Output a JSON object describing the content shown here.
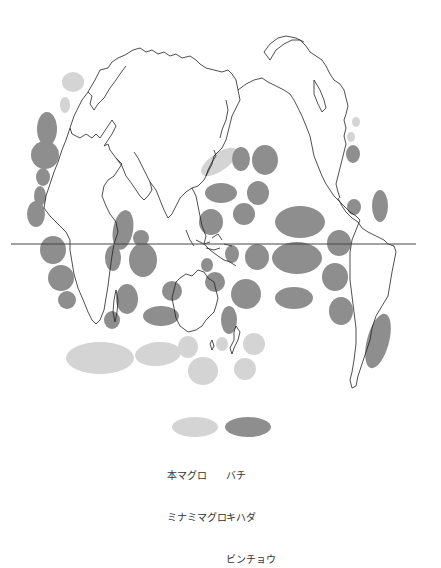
{
  "map": {
    "title": "",
    "projection": "polar-centered world map",
    "equator_line": {
      "x1": 11,
      "x2": 416,
      "y": 244,
      "color": "#444444"
    },
    "colors": {
      "light_species": "#d4d4d4",
      "dark_species": "#8e8e8e",
      "coastline": "#222222",
      "background": "#ffffff"
    },
    "light_areas": [
      {
        "cx": 73,
        "cy": 82,
        "rx": 11,
        "ry": 10,
        "rot": 0
      },
      {
        "cx": 65,
        "cy": 105,
        "rx": 5,
        "ry": 8,
        "rot": 0
      },
      {
        "cx": 356,
        "cy": 122,
        "rx": 4,
        "ry": 5,
        "rot": 0
      },
      {
        "cx": 351,
        "cy": 137,
        "rx": 4,
        "ry": 5,
        "rot": 0
      },
      {
        "cx": 219,
        "cy": 162,
        "rx": 21,
        "ry": 9,
        "rot": -35
      },
      {
        "cx": 100,
        "cy": 358,
        "rx": 34,
        "ry": 16,
        "rot": 0
      },
      {
        "cx": 158,
        "cy": 354,
        "rx": 23,
        "ry": 12,
        "rot": -5
      },
      {
        "cx": 188,
        "cy": 347,
        "rx": 10,
        "ry": 11,
        "rot": 0
      },
      {
        "cx": 203,
        "cy": 371,
        "rx": 15,
        "ry": 14,
        "rot": 0
      },
      {
        "cx": 222,
        "cy": 344,
        "rx": 6,
        "ry": 7,
        "rot": 0
      },
      {
        "cx": 254,
        "cy": 344,
        "rx": 11,
        "ry": 11,
        "rot": 0
      },
      {
        "cx": 245,
        "cy": 369,
        "rx": 11,
        "ry": 11,
        "rot": 0
      }
    ],
    "dark_areas": [
      {
        "cx": 47,
        "cy": 129,
        "rx": 10,
        "ry": 17,
        "rot": 0
      },
      {
        "cx": 45,
        "cy": 155,
        "rx": 14,
        "ry": 14,
        "rot": 0
      },
      {
        "cx": 43,
        "cy": 177,
        "rx": 7,
        "ry": 9,
        "rot": 0
      },
      {
        "cx": 40,
        "cy": 196,
        "rx": 6,
        "ry": 10,
        "rot": 0
      },
      {
        "cx": 36,
        "cy": 214,
        "rx": 9,
        "ry": 13,
        "rot": 0
      },
      {
        "cx": 53,
        "cy": 250,
        "rx": 13,
        "ry": 14,
        "rot": 0
      },
      {
        "cx": 61,
        "cy": 278,
        "rx": 13,
        "ry": 13,
        "rot": 0
      },
      {
        "cx": 67,
        "cy": 300,
        "rx": 9,
        "ry": 9,
        "rot": 0
      },
      {
        "cx": 123,
        "cy": 230,
        "rx": 10,
        "ry": 20,
        "rot": 10
      },
      {
        "cx": 141,
        "cy": 238,
        "rx": 8,
        "ry": 8,
        "rot": 0
      },
      {
        "cx": 143,
        "cy": 260,
        "rx": 14,
        "ry": 17,
        "rot": 0
      },
      {
        "cx": 113,
        "cy": 258,
        "rx": 8,
        "ry": 13,
        "rot": 0
      },
      {
        "cx": 127,
        "cy": 299,
        "rx": 11,
        "ry": 15,
        "rot": 0
      },
      {
        "cx": 112,
        "cy": 320,
        "rx": 8,
        "ry": 9,
        "rot": 0
      },
      {
        "cx": 172,
        "cy": 291,
        "rx": 10,
        "ry": 10,
        "rot": 0
      },
      {
        "cx": 161,
        "cy": 316,
        "rx": 18,
        "ry": 10,
        "rot": 0
      },
      {
        "cx": 241,
        "cy": 159,
        "rx": 9,
        "ry": 12,
        "rot": 0
      },
      {
        "cx": 265,
        "cy": 160,
        "rx": 13,
        "ry": 15,
        "rot": 0
      },
      {
        "cx": 221,
        "cy": 193,
        "rx": 16,
        "ry": 10,
        "rot": 0
      },
      {
        "cx": 258,
        "cy": 193,
        "rx": 11,
        "ry": 12,
        "rot": 0
      },
      {
        "cx": 211,
        "cy": 222,
        "rx": 12,
        "ry": 13,
        "rot": 0
      },
      {
        "cx": 244,
        "cy": 214,
        "rx": 11,
        "ry": 11,
        "rot": 0
      },
      {
        "cx": 300,
        "cy": 222,
        "rx": 25,
        "ry": 16,
        "rot": 0
      },
      {
        "cx": 297,
        "cy": 258,
        "rx": 25,
        "ry": 16,
        "rot": 0
      },
      {
        "cx": 257,
        "cy": 257,
        "rx": 12,
        "ry": 13,
        "rot": 0
      },
      {
        "cx": 232,
        "cy": 254,
        "rx": 7,
        "ry": 9,
        "rot": 0
      },
      {
        "cx": 339,
        "cy": 243,
        "rx": 12,
        "ry": 13,
        "rot": 0
      },
      {
        "cx": 335,
        "cy": 277,
        "rx": 13,
        "ry": 14,
        "rot": 0
      },
      {
        "cx": 341,
        "cy": 311,
        "rx": 12,
        "ry": 14,
        "rot": 0
      },
      {
        "cx": 215,
        "cy": 282,
        "rx": 10,
        "ry": 10,
        "rot": 0
      },
      {
        "cx": 246,
        "cy": 294,
        "rx": 15,
        "ry": 15,
        "rot": 0
      },
      {
        "cx": 294,
        "cy": 298,
        "rx": 19,
        "ry": 11,
        "rot": 0
      },
      {
        "cx": 229,
        "cy": 320,
        "rx": 8,
        "ry": 14,
        "rot": 0
      },
      {
        "cx": 353,
        "cy": 154,
        "rx": 7,
        "ry": 9,
        "rot": 0
      },
      {
        "cx": 380,
        "cy": 206,
        "rx": 8,
        "ry": 16,
        "rot": 0
      },
      {
        "cx": 354,
        "cy": 207,
        "rx": 7,
        "ry": 8,
        "rot": 0
      },
      {
        "cx": 378,
        "cy": 341,
        "rx": 11,
        "ry": 28,
        "rot": 15
      },
      {
        "cx": 207,
        "cy": 265,
        "rx": 6,
        "ry": 7,
        "rot": 0
      }
    ]
  },
  "legend": {
    "light": {
      "color": "#d4d4d4",
      "labels": [
        "本マグロ",
        "ミナミマグロ"
      ]
    },
    "dark": {
      "color": "#8e8e8e",
      "labels": [
        "バチ",
        "キハダ",
        "ビンチョウ"
      ]
    }
  }
}
